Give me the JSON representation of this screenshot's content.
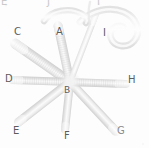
{
  "figure": {
    "width": 149,
    "height": 148,
    "background_color": "#fdfdfd",
    "modality": "grayscale micrograph",
    "label_color": "#5c5c5c",
    "structure_color": "#e3e3e3",
    "structure_core_color": "#f6f6f6",
    "structure_edge_color": "#cfcfcf"
  },
  "labels": [
    {
      "id": "label-c",
      "text": "C",
      "x": 14,
      "y": 27,
      "style": "normal"
    },
    {
      "id": "label-a",
      "text": "A",
      "x": 56,
      "y": 27,
      "style": "normal"
    },
    {
      "id": "label-i",
      "text": "I",
      "x": 103,
      "y": 28,
      "style": "normal"
    },
    {
      "id": "label-d",
      "text": "D",
      "x": 5,
      "y": 74,
      "style": "normal"
    },
    {
      "id": "label-h",
      "text": "H",
      "x": 128,
      "y": 75,
      "style": "normal"
    },
    {
      "id": "label-b",
      "text": "B",
      "x": 64,
      "y": 85,
      "style": "normal"
    },
    {
      "id": "label-e",
      "text": "E",
      "x": 13,
      "y": 126,
      "style": "normal"
    },
    {
      "id": "label-f",
      "text": "F",
      "x": 64,
      "y": 131,
      "style": "normal"
    },
    {
      "id": "label-g",
      "text": "G",
      "x": 117,
      "y": 126,
      "style": "normal"
    },
    {
      "id": "label-top-left-fragment",
      "text": "E",
      "x": 1,
      "y": 0,
      "style": "faint"
    },
    {
      "id": "label-top-mid-fragment",
      "text": "J",
      "x": 47,
      "y": 0,
      "style": "faint"
    },
    {
      "id": "label-top-right-fragment",
      "text": "I",
      "x": 97,
      "y": 0,
      "style": "faint"
    }
  ],
  "arms": [
    {
      "id": "arm-a",
      "label": "A",
      "angle_deg": 258,
      "length": 62,
      "width": 9,
      "striated": true,
      "note": "upper-near-vertical arm from center to A"
    },
    {
      "id": "arm-c",
      "label": "C",
      "angle_deg": 215,
      "length": 72,
      "width": 10,
      "striated": true,
      "note": "upper-left diagonal arm toward C"
    },
    {
      "id": "arm-d",
      "label": "D",
      "angle_deg": 182,
      "length": 62,
      "width": 8,
      "striated": true,
      "note": "left horizontal arm toward D"
    },
    {
      "id": "arm-e",
      "label": "E",
      "angle_deg": 142,
      "length": 70,
      "width": 9,
      "striated": false,
      "note": "lower-left diagonal arm toward E"
    },
    {
      "id": "arm-f",
      "label": "F",
      "angle_deg": 96,
      "length": 52,
      "width": 8,
      "striated": false,
      "note": "lower vertical arm toward F"
    },
    {
      "id": "arm-g",
      "label": "G",
      "angle_deg": 47,
      "length": 72,
      "width": 9,
      "striated": false,
      "note": "lower-right diagonal arm toward G"
    },
    {
      "id": "arm-h",
      "label": "H",
      "angle_deg": 2,
      "length": 60,
      "width": 8,
      "striated": true,
      "note": "right horizontal arm toward H"
    },
    {
      "id": "arm-i",
      "label": "I",
      "angle_deg": 290,
      "length": 78,
      "width": 6,
      "striated": false,
      "note": "long thin arm rising to upper right"
    }
  ],
  "filaments": [
    {
      "id": "filament-hook-top-right",
      "note": "curved hook-shaped filament spanning top-right, curling clockwise",
      "width": 7
    },
    {
      "id": "filament-arc-top-center",
      "note": "short arc above center near label A",
      "width": 6
    }
  ],
  "center": {
    "id": "hub-b",
    "label": "B",
    "x": 70,
    "y": 82,
    "radius": 6
  }
}
